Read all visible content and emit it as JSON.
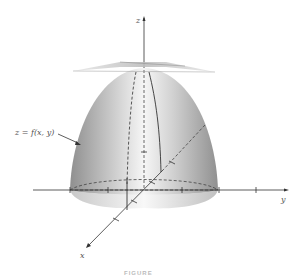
{
  "figure": {
    "surface_label": "z = f(x, y)",
    "axes": {
      "x": "x",
      "y": "y",
      "z": "z"
    },
    "caption": "FIGURE"
  },
  "colors": {
    "surface_light": "#f2f2f2",
    "surface_dark": "#9a9a9a",
    "axis": "#333333",
    "plane": "#cfcfcf"
  }
}
